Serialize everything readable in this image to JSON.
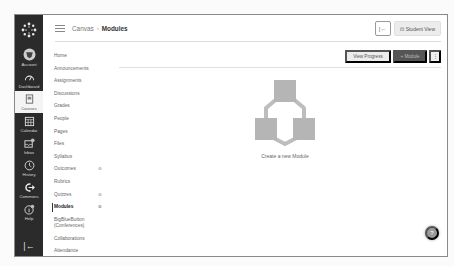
{
  "global_nav": {
    "items": [
      {
        "label": "Account",
        "icon": "account-icon"
      },
      {
        "label": "Dashboard",
        "icon": "dashboard-icon"
      },
      {
        "label": "Courses",
        "icon": "courses-icon",
        "active": true
      },
      {
        "label": "Calendar",
        "icon": "calendar-icon"
      },
      {
        "label": "Inbox",
        "icon": "inbox-icon"
      },
      {
        "label": "History",
        "icon": "history-icon"
      },
      {
        "label": "Commons",
        "icon": "commons-icon"
      },
      {
        "label": "Help",
        "icon": "help-icon"
      }
    ],
    "collapse_glyph": "|←"
  },
  "header": {
    "breadcrumb": [
      "Canvas",
      "Modules"
    ],
    "separator": "›",
    "collapse_button_glyph": "|←",
    "student_view_label": "Student View",
    "student_view_glyph": "⊡"
  },
  "course_nav": {
    "items": [
      {
        "label": "Home"
      },
      {
        "label": "Announcements"
      },
      {
        "label": "Assignments"
      },
      {
        "label": "Discussions"
      },
      {
        "label": "Grades"
      },
      {
        "label": "People"
      },
      {
        "label": "Pages"
      },
      {
        "label": "Files"
      },
      {
        "label": "Syllabus"
      },
      {
        "label": "Outcomes",
        "hidden_icon": true
      },
      {
        "label": "Rubrics"
      },
      {
        "label": "Quizzes",
        "hidden_icon": true
      },
      {
        "label": "Modules",
        "hidden_icon": true,
        "active": true
      },
      {
        "label": "BigBlueButton (Conferences)"
      },
      {
        "label": "Collaborations"
      },
      {
        "label": "Attendance"
      }
    ],
    "hidden_glyph": "⊘"
  },
  "toolbar": {
    "view_progress_label": "View Progress",
    "add_module_label": "+ Module",
    "more_glyph": "⋮"
  },
  "empty_state": {
    "caption": "Create a new Module"
  },
  "help_fab": {
    "glyph": "?"
  },
  "colors": {
    "global_nav_bg": "#2b2b2b",
    "add_module_bg": "#555555",
    "illustration": "#b5b5b5"
  }
}
